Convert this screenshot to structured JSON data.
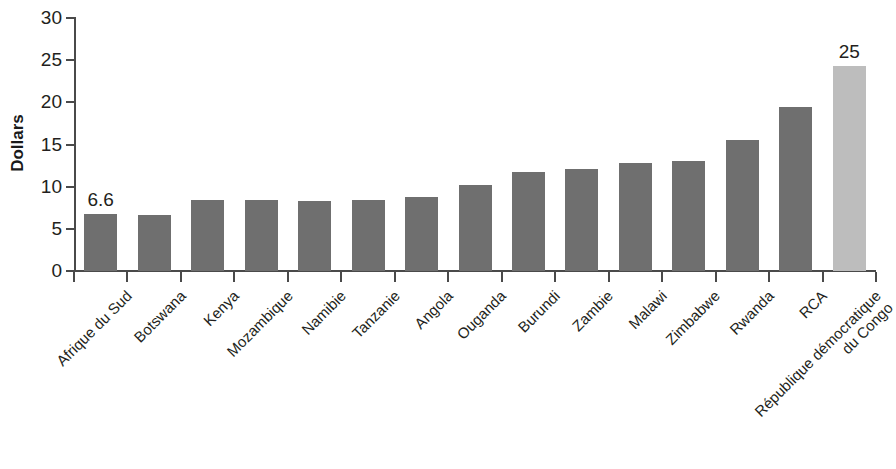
{
  "chart_data": {
    "type": "bar",
    "title": "",
    "xlabel": "",
    "ylabel": "Dollars",
    "ylim": [
      0,
      30
    ],
    "ytick_labels": [
      "0",
      "5",
      "10",
      "15",
      "20",
      "25",
      "30"
    ],
    "yticks": [
      0,
      5,
      10,
      15,
      20,
      25,
      30
    ],
    "grid": false,
    "legend": null,
    "categories": [
      "Afrique du Sud",
      "Botswana",
      "Kenya",
      "Mozambique",
      "Namibie",
      "Tanzanie",
      "Angola",
      "Ouganda",
      "Burundi",
      "Zambie",
      "Malawi",
      "Zimbabwe",
      "Rwanda",
      "RCA",
      "République démocratique\ndu Congo"
    ],
    "values": [
      6.8,
      6.7,
      8.4,
      8.4,
      8.3,
      8.4,
      8.8,
      10.2,
      11.7,
      12.1,
      12.8,
      13.0,
      15.5,
      19.5,
      24.3
    ],
    "bar_colors": [
      "#6f6f6f",
      "#6f6f6f",
      "#6f6f6f",
      "#6f6f6f",
      "#6f6f6f",
      "#6f6f6f",
      "#6f6f6f",
      "#6f6f6f",
      "#6f6f6f",
      "#6f6f6f",
      "#6f6f6f",
      "#6f6f6f",
      "#6f6f6f",
      "#6f6f6f",
      "#bdbdbd"
    ],
    "data_labels": [
      {
        "index": 0,
        "text": "6.6"
      },
      {
        "index": 14,
        "text": "25"
      }
    ],
    "axis_color": "#4a4a4a",
    "text_color": "#231f20",
    "background": "#ffffff"
  }
}
